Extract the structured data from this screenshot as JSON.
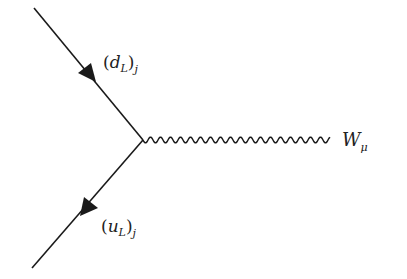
{
  "diagram": {
    "type": "feynman-vertex",
    "colors": {
      "line": "#1a1a1a",
      "text": "#222222",
      "background": "#ffffff"
    },
    "particles": [
      {
        "id": "incoming-quark",
        "kind": "fermion",
        "direction": "into-vertex",
        "label": {
          "paren_open": "(",
          "symbol": "d",
          "sub": "L",
          "paren_close": ")",
          "index": "j"
        }
      },
      {
        "id": "outgoing-quark",
        "kind": "fermion",
        "direction": "out-of-vertex",
        "label": {
          "paren_open": "(",
          "symbol": "u",
          "sub": "L",
          "paren_close": ")",
          "index": "j"
        }
      },
      {
        "id": "w-boson",
        "kind": "boson",
        "line_style": "wavy",
        "label": {
          "symbol": "W",
          "sub": "μ"
        }
      }
    ]
  }
}
